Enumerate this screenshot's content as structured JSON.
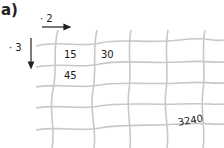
{
  "exercise": {
    "label": "a)",
    "right_operator": "· 2",
    "down_operator": "· 3",
    "cells": {
      "r1c1": "15",
      "r1c2": "30",
      "r2c1": "45",
      "r5c4": "3240"
    }
  },
  "colors": {
    "grid": "#c8c8c8",
    "text": "#1a1a1a",
    "arrow": "#222222"
  }
}
